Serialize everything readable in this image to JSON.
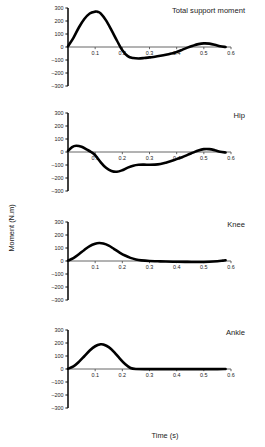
{
  "figure": {
    "xlabel": "Time (s)",
    "ylabel": "Moment (N.m)"
  },
  "chart_data": [
    {
      "type": "line",
      "title": "Total support moment",
      "xlabel": "Time (s)",
      "ylabel": "Moment (N.m)",
      "xlim": [
        0,
        0.6
      ],
      "ylim": [
        -300,
        300
      ],
      "xticks": [
        0.1,
        0.2,
        0.3,
        0.4,
        0.5,
        0.6
      ],
      "xticklabels": [
        "0.1",
        "0.2",
        "0.3",
        "0.4",
        "0.5",
        "0.6"
      ],
      "yticks": [
        300,
        200,
        100,
        0,
        -100,
        -200,
        -300
      ],
      "yticklabels": [
        "300",
        "200",
        "100",
        "0",
        "–100",
        "–200",
        "–300"
      ],
      "grid": false,
      "legend": "none",
      "x": [
        0,
        0.02,
        0.04,
        0.06,
        0.08,
        0.1,
        0.11,
        0.12,
        0.14,
        0.16,
        0.18,
        0.2,
        0.22,
        0.24,
        0.26,
        0.28,
        0.3,
        0.32,
        0.34,
        0.36,
        0.38,
        0.4,
        0.42,
        0.44,
        0.46,
        0.48,
        0.5,
        0.52,
        0.54,
        0.56,
        0.58
      ],
      "values": [
        5,
        70,
        150,
        215,
        258,
        272,
        270,
        258,
        205,
        130,
        50,
        -25,
        -70,
        -85,
        -88,
        -85,
        -80,
        -75,
        -68,
        -60,
        -50,
        -38,
        -22,
        -5,
        10,
        22,
        28,
        26,
        18,
        6,
        0
      ]
    },
    {
      "type": "line",
      "title": "Hip",
      "xlabel": "Time (s)",
      "ylabel": "Moment (N.m)",
      "xlim": [
        0,
        0.6
      ],
      "ylim": [
        -300,
        300
      ],
      "xticks": [
        0.1,
        0.2,
        0.3,
        0.4,
        0.5,
        0.6
      ],
      "xticklabels": [
        "0.1",
        "0.2",
        "0.3",
        "0.4",
        "0.5",
        "0.6"
      ],
      "yticks": [
        300,
        200,
        100,
        0,
        -100,
        -200,
        -300
      ],
      "yticklabels": [
        "300",
        "200",
        "100",
        "0",
        "–100",
        "–200",
        "–300"
      ],
      "grid": false,
      "legend": "none",
      "x": [
        0,
        0.015,
        0.03,
        0.05,
        0.07,
        0.085,
        0.1,
        0.12,
        0.14,
        0.16,
        0.18,
        0.2,
        0.22,
        0.24,
        0.26,
        0.28,
        0.3,
        0.32,
        0.34,
        0.36,
        0.38,
        0.4,
        0.42,
        0.44,
        0.46,
        0.48,
        0.5,
        0.52,
        0.54,
        0.56,
        0.58
      ],
      "values": [
        8,
        38,
        48,
        40,
        18,
        0,
        -25,
        -78,
        -122,
        -146,
        -152,
        -140,
        -120,
        -105,
        -98,
        -97,
        -98,
        -97,
        -92,
        -82,
        -70,
        -55,
        -40,
        -22,
        -5,
        12,
        22,
        22,
        14,
        2,
        -4
      ]
    },
    {
      "type": "line",
      "title": "Knee",
      "xlabel": "Time (s)",
      "ylabel": "Moment (N.m)",
      "xlim": [
        0,
        0.6
      ],
      "ylim": [
        -300,
        300
      ],
      "xticks": [
        0.1,
        0.2,
        0.3,
        0.4,
        0.5,
        0.6
      ],
      "xticklabels": [
        "0.1",
        "0.2",
        "0.3",
        "0.4",
        "0.5",
        "0.6"
      ],
      "yticks": [
        300,
        200,
        100,
        0,
        -100,
        -200,
        -300
      ],
      "yticklabels": [
        "300",
        "200",
        "100",
        "0",
        "–100",
        "–200",
        "–300"
      ],
      "grid": false,
      "legend": "none",
      "x": [
        0,
        0.02,
        0.04,
        0.06,
        0.08,
        0.1,
        0.115,
        0.13,
        0.15,
        0.17,
        0.19,
        0.21,
        0.23,
        0.25,
        0.27,
        0.3,
        0.33,
        0.36,
        0.4,
        0.44,
        0.48,
        0.52,
        0.55,
        0.57,
        0.58
      ],
      "values": [
        3,
        22,
        52,
        85,
        115,
        133,
        138,
        134,
        118,
        92,
        65,
        42,
        24,
        12,
        5,
        0,
        -2,
        -4,
        -6,
        -7,
        -8,
        -6,
        -2,
        3,
        6
      ]
    },
    {
      "type": "line",
      "title": "Ankle",
      "xlabel": "Time (s)",
      "ylabel": "Moment (N.m)",
      "xlim": [
        0,
        0.6
      ],
      "ylim": [
        -300,
        300
      ],
      "xticks": [
        0.1,
        0.2,
        0.3,
        0.4,
        0.5,
        0.6
      ],
      "xticklabels": [
        "0.1",
        "0.2",
        "0.3",
        "0.4",
        "0.5",
        "0.6"
      ],
      "yticks": [
        300,
        200,
        100,
        0,
        -100,
        -200,
        -300
      ],
      "yticklabels": [
        "300",
        "200",
        "100",
        "0",
        "–100",
        "–200",
        "–300"
      ],
      "grid": false,
      "legend": "none",
      "x": [
        0,
        0.02,
        0.04,
        0.06,
        0.08,
        0.1,
        0.12,
        0.13,
        0.15,
        0.17,
        0.19,
        0.21,
        0.23,
        0.25,
        0.3,
        0.35,
        0.4,
        0.45,
        0.5,
        0.55,
        0.58
      ],
      "values": [
        2,
        20,
        55,
        98,
        142,
        175,
        190,
        188,
        168,
        130,
        82,
        38,
        8,
        0,
        -1,
        -1,
        -1,
        -1,
        -1,
        -1,
        0
      ]
    }
  ]
}
